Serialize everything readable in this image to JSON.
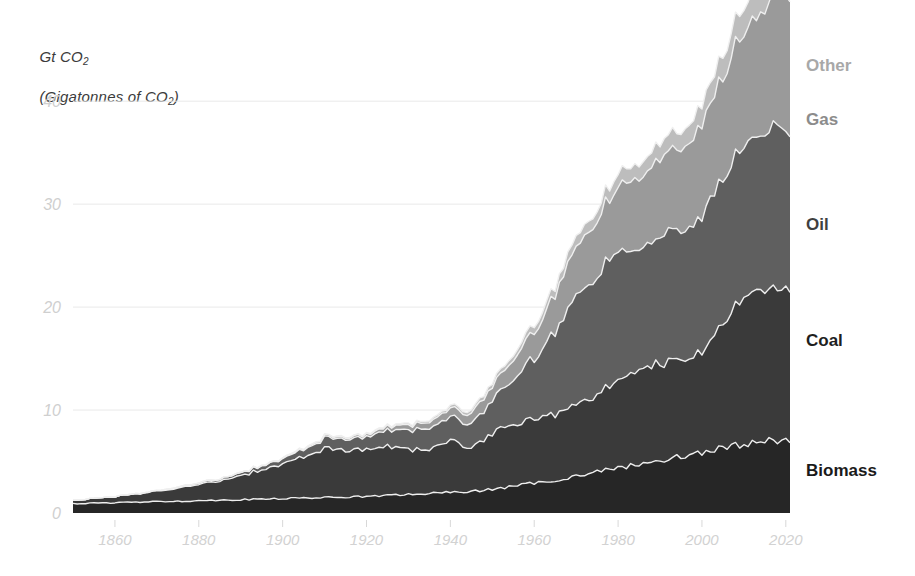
{
  "chart_data": {
    "type": "area",
    "stacked": true,
    "title": "Gt CO2",
    "subtitle": "(Gigatonnes of CO2)",
    "ylabel": "Gt CO2 (Gigatonnes of CO2)",
    "xlabel": "",
    "xlim": [
      1850,
      2021
    ],
    "ylim": [
      0,
      44
    ],
    "grid": true,
    "grid_axis": "y",
    "legend_position": "right-inline",
    "yticks": [
      0,
      10,
      20,
      30,
      40
    ],
    "ytick_labels": [
      "0",
      "10",
      "20",
      "30",
      "40"
    ],
    "xticks": [
      1860,
      1880,
      1900,
      1920,
      1940,
      1960,
      1980,
      2000,
      2020
    ],
    "xtick_labels": [
      "1860",
      "1880",
      "1900",
      "1920",
      "1940",
      "1960",
      "1980",
      "2000",
      "2020"
    ],
    "x": [
      1850,
      1855,
      1860,
      1865,
      1870,
      1875,
      1880,
      1885,
      1890,
      1895,
      1900,
      1905,
      1910,
      1915,
      1920,
      1925,
      1930,
      1935,
      1940,
      1945,
      1950,
      1955,
      1960,
      1965,
      1970,
      1975,
      1980,
      1985,
      1990,
      1995,
      2000,
      2005,
      2010,
      2015,
      2018,
      2021
    ],
    "series": [
      {
        "name": "Biomass",
        "color": "#262626",
        "values": [
          0.9,
          0.95,
          1.0,
          1.05,
          1.1,
          1.15,
          1.2,
          1.25,
          1.3,
          1.35,
          1.4,
          1.45,
          1.5,
          1.55,
          1.6,
          1.7,
          1.8,
          1.9,
          2.0,
          2.1,
          2.3,
          2.6,
          2.9,
          3.2,
          3.6,
          4.0,
          4.4,
          4.7,
          5.1,
          5.5,
          5.9,
          6.3,
          6.7,
          7.0,
          7.1,
          7.1
        ]
      },
      {
        "name": "Coal",
        "color": "#3a3a3a",
        "values": [
          0.35,
          0.45,
          0.6,
          0.8,
          1.0,
          1.3,
          1.6,
          1.9,
          2.4,
          2.8,
          3.4,
          4.0,
          4.7,
          4.6,
          4.5,
          4.8,
          4.4,
          4.3,
          5.0,
          4.3,
          5.4,
          5.9,
          6.3,
          6.5,
          6.9,
          7.5,
          8.4,
          9.2,
          9.5,
          9.6,
          9.6,
          12.2,
          14.4,
          14.8,
          14.6,
          14.3
        ]
      },
      {
        "name": "Oil",
        "color": "#5f5f5f",
        "values": [
          0.0,
          0.0,
          0.0,
          0.02,
          0.05,
          0.1,
          0.15,
          0.2,
          0.3,
          0.4,
          0.5,
          0.7,
          1.0,
          1.1,
          1.2,
          1.6,
          1.9,
          2.0,
          2.3,
          2.4,
          3.2,
          4.4,
          5.9,
          7.9,
          10.8,
          11.6,
          12.6,
          11.5,
          12.3,
          12.7,
          13.4,
          14.1,
          14.6,
          15.4,
          15.8,
          14.7
        ]
      },
      {
        "name": "Gas",
        "color": "#9a9a9a",
        "values": [
          0.0,
          0.0,
          0.0,
          0.0,
          0.0,
          0.0,
          0.0,
          0.0,
          0.02,
          0.04,
          0.06,
          0.1,
          0.15,
          0.18,
          0.22,
          0.35,
          0.5,
          0.6,
          0.8,
          1.0,
          1.4,
          1.9,
          2.6,
          3.5,
          4.8,
          5.4,
          6.2,
          6.9,
          7.6,
          8.1,
          8.9,
          9.9,
          11.1,
          12.1,
          12.9,
          13.0
        ]
      },
      {
        "name": "Other",
        "color": "#bdbdbd",
        "values": [
          0.0,
          0.0,
          0.0,
          0.0,
          0.0,
          0.0,
          0.0,
          0.0,
          0.0,
          0.0,
          0.02,
          0.03,
          0.05,
          0.06,
          0.08,
          0.1,
          0.15,
          0.18,
          0.25,
          0.3,
          0.4,
          0.5,
          0.65,
          0.8,
          1.0,
          1.1,
          1.3,
          1.4,
          1.6,
          1.7,
          1.9,
          2.2,
          2.5,
          2.8,
          3.0,
          3.0
        ]
      }
    ],
    "totals_note": "Peak total approx 42 Gt CO2 around 2018-2019"
  },
  "labels": {
    "title_line1": "Gt CO",
    "title_sub1": "2",
    "title_line2_open": "(Gigatonnes of CO",
    "title_sub2": "2",
    "title_line2_close": ")"
  },
  "legend": [
    {
      "name": "other",
      "label": "Other",
      "color": "#a8a8a8",
      "top": 56,
      "left": 806
    },
    {
      "name": "gas",
      "label": "Gas",
      "color": "#8c8c8c",
      "top": 110,
      "left": 806
    },
    {
      "name": "oil",
      "label": "Oil",
      "color": "#3f3f3f",
      "top": 215,
      "left": 806
    },
    {
      "name": "coal",
      "label": "Coal",
      "color": "#1f1f1f",
      "top": 331,
      "left": 806
    },
    {
      "name": "biomass",
      "label": "Biomass",
      "color": "#1a1a1a",
      "top": 461,
      "left": 806
    }
  ],
  "colors": {
    "background": "#ffffff",
    "gridline": "#e9e9e9",
    "tick_text": "#d2d2d2",
    "title_text": "#3b3b3b",
    "separator": "#efefef"
  }
}
